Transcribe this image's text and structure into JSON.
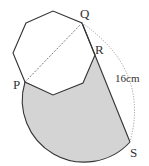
{
  "diagram": {
    "type": "geometry",
    "shape": "regular octagon with shaded sector region",
    "labels": {
      "P": "P",
      "Q": "Q",
      "R": "R",
      "S": "S",
      "length": "16cm"
    },
    "colors": {
      "stroke": "#333333",
      "shade": "#d4d4d4",
      "dotted": "#888888"
    },
    "points": {
      "octagon": [
        [
          26,
          23
        ],
        [
          53,
          11
        ],
        [
          82,
          23
        ],
        [
          95,
          55
        ],
        [
          83,
          83
        ],
        [
          53,
          95
        ],
        [
          25,
          82
        ],
        [
          13,
          53
        ]
      ],
      "P": [
        25,
        82
      ],
      "Q": [
        82,
        23
      ],
      "R": [
        95,
        55
      ],
      "S": [
        130,
        142
      ]
    }
  }
}
